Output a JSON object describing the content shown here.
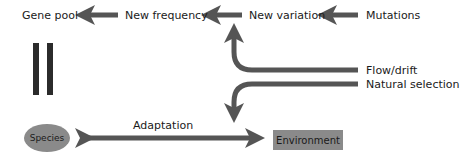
{
  "diagram": {
    "nodes": {
      "gene_pool": "Gene pool",
      "new_frequency": "New frequency",
      "new_variation": "New variation",
      "mutations": "Mutations",
      "flow_drift": "Flow/drift",
      "natural_selection": "Natural selection",
      "species": "Species",
      "environment": "Environment"
    },
    "edge_labels": {
      "adaptation": "Adaptation"
    },
    "edges": [
      {
        "from": "Mutations",
        "to": "New variation"
      },
      {
        "from": "New variation",
        "to": "New frequency"
      },
      {
        "from": "New frequency",
        "to": "Gene pool"
      },
      {
        "from": "Flow/drift",
        "to": "New variation"
      },
      {
        "from": "Natural selection",
        "to": "Adaptation"
      },
      {
        "from": "Species",
        "to": "Environment",
        "bidirectional": true,
        "label": "Adaptation"
      }
    ],
    "colors": {
      "arrow": "#555555",
      "node_fill": "#8a8a8a",
      "bars": "#2b2b2b"
    }
  }
}
